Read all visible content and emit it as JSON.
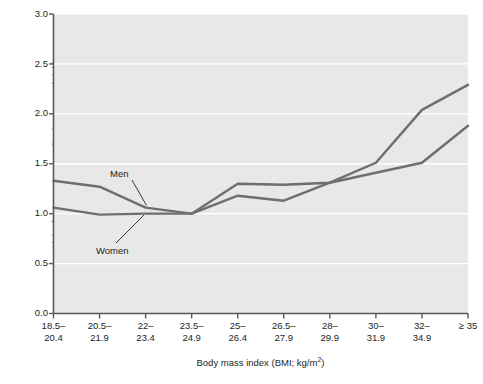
{
  "chart_data": {
    "type": "line",
    "title": "",
    "xlabel": "Body mass index (BMI; kg/m2)",
    "ylabel": "Risk of premature mortality (1 = normal risk)",
    "categories": [
      "18.5–20.4",
      "20.5–21.9",
      "22–23.4",
      "23.5–24.9",
      "25–26.4",
      "26.5–27.9",
      "28–29.9",
      "30–31.9",
      "32–34.9",
      "≥ 35"
    ],
    "series": [
      {
        "name": "Men",
        "color": "#6e6e6e",
        "values": [
          1.33,
          1.27,
          1.06,
          1.0,
          1.3,
          1.29,
          1.31,
          1.51,
          2.04,
          2.29
        ]
      },
      {
        "name": "Women",
        "color": "#6e6e6e",
        "values": [
          1.06,
          0.99,
          1.0,
          1.0,
          1.18,
          1.13,
          1.31,
          1.41,
          1.51,
          1.88
        ]
      }
    ],
    "ylim": [
      0.0,
      3.0
    ],
    "yticks": [
      "0.0",
      "0.5",
      "1.0",
      "1.5",
      "2.0",
      "2.5",
      "3.0"
    ],
    "ytick_values": [
      0.0,
      0.5,
      1.0,
      1.5,
      2.0,
      2.5,
      3.0
    ],
    "grid": true,
    "grid_color": "#ffffff",
    "plot_background": "#e8e8e8",
    "axis_color": "#58595b",
    "legend": "inline-annotations",
    "annotations": [
      {
        "text": "Men",
        "target_series": "Men",
        "target_index": 2
      },
      {
        "text": "Women",
        "target_series": "Women",
        "target_index": 2
      }
    ]
  },
  "axis_titles": {
    "y": "Risk of premature mortality (1 = normal risk)",
    "x_prefix": "Body mass index (BMI; kg/m",
    "x_exponent": "2",
    "x_suffix": ")"
  }
}
